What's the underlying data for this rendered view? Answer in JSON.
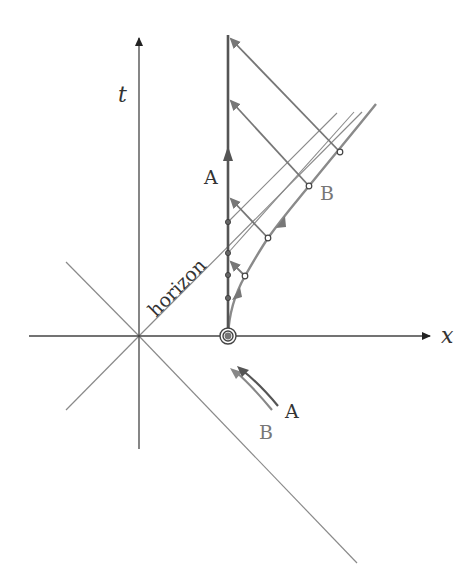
{
  "diagram": {
    "axes": {
      "x_label": "x",
      "t_label": "t"
    },
    "labels": {
      "horizon": "horizon",
      "observer_a": "A",
      "observer_b": "B",
      "legend_a": "A",
      "legend_b": "B"
    },
    "colors": {
      "axis": "#444444",
      "light_cone": "#888888",
      "worldline_a": "#555555",
      "worldline_b": "#888888",
      "signals": "#777777",
      "text": "#333333",
      "text_b": "#777777"
    },
    "geometry": {
      "origin": [
        139,
        336
      ],
      "worldline_a_x": 228,
      "worldline_a_top": 35,
      "a_event_dots_y": [
        222,
        253,
        275,
        298
      ],
      "b_event_dots": [
        [
          245,
          276
        ],
        [
          268,
          238
        ],
        [
          309,
          186
        ],
        [
          340,
          152
        ]
      ]
    }
  }
}
